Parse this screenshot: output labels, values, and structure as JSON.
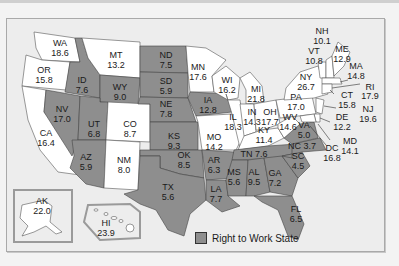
{
  "legend": {
    "label": "Right to Work State",
    "swatch_color": "#8e8e8e"
  },
  "colors": {
    "right_to_work": "#8e8e8e",
    "non_right_to_work": "#ffffff",
    "background": "#ededed"
  },
  "states": {
    "WA": {
      "value": "18.6",
      "rtw": false
    },
    "OR": {
      "value": "15.8",
      "rtw": false
    },
    "CA": {
      "value": "16.4",
      "rtw": false
    },
    "ID": {
      "value": "7.6",
      "rtw": true
    },
    "NV": {
      "value": "17.0",
      "rtw": true
    },
    "MT": {
      "value": "13.2",
      "rtw": false
    },
    "WY": {
      "value": "9.0",
      "rtw": true
    },
    "UT": {
      "value": "6.8",
      "rtw": true
    },
    "AZ": {
      "value": "5.9",
      "rtw": true
    },
    "CO": {
      "value": "8.7",
      "rtw": false
    },
    "NM": {
      "value": "8.0",
      "rtw": false
    },
    "ND": {
      "value": "7.5",
      "rtw": true
    },
    "SD": {
      "value": "5.9",
      "rtw": true
    },
    "NE": {
      "value": "7.8",
      "rtw": true
    },
    "KS": {
      "value": "9.3",
      "rtw": true
    },
    "OK": {
      "value": "8.5",
      "rtw": true
    },
    "TX": {
      "value": "5.6",
      "rtw": true
    },
    "MN": {
      "value": "17.6",
      "rtw": false
    },
    "IA": {
      "value": "12.8",
      "rtw": true
    },
    "MO": {
      "value": "14.2",
      "rtw": false
    },
    "AR": {
      "value": "6.3",
      "rtw": true
    },
    "LA": {
      "value": "7.7",
      "rtw": true
    },
    "WI": {
      "value": "16.2",
      "rtw": false
    },
    "IL": {
      "value": "18.3",
      "rtw": false
    },
    "MI": {
      "value": "21.8",
      "rtw": false
    },
    "IN": {
      "value": "14.3",
      "rtw": false
    },
    "OH": {
      "value": "17.7",
      "rtw": false
    },
    "KY": {
      "value": "11.4",
      "rtw": false
    },
    "TN": {
      "value": "7.6",
      "rtw": true
    },
    "MS": {
      "value": "5.6",
      "rtw": true
    },
    "AL": {
      "value": "9.5",
      "rtw": true
    },
    "GA": {
      "value": "7.2",
      "rtw": true
    },
    "FL": {
      "value": "6.5",
      "rtw": true
    },
    "SC": {
      "value": "4.5",
      "rtw": true
    },
    "NC": {
      "value": "3.7",
      "rtw": true
    },
    "VA": {
      "value": "5.0",
      "rtw": true
    },
    "WV": {
      "value": "14.6",
      "rtw": false
    },
    "PA": {
      "value": "17.0",
      "rtw": false
    },
    "NY": {
      "value": "26.7",
      "rtw": false
    },
    "VT": {
      "value": "10.8",
      "rtw": false
    },
    "NH": {
      "value": "10.1",
      "rtw": false
    },
    "ME": {
      "value": "12.9",
      "rtw": false
    },
    "MA": {
      "value": "14.8",
      "rtw": false
    },
    "RI": {
      "value": "17.9",
      "rtw": false
    },
    "CT": {
      "value": "15.8",
      "rtw": false
    },
    "NJ": {
      "value": "19.6",
      "rtw": false
    },
    "DE": {
      "value": "12.2",
      "rtw": false
    },
    "MD": {
      "value": "14.1",
      "rtw": false
    },
    "DC": {
      "value": "16.8",
      "rtw": false
    },
    "AK": {
      "value": "22.0",
      "rtw": false
    },
    "HI": {
      "value": "23.9",
      "rtw": false
    }
  }
}
